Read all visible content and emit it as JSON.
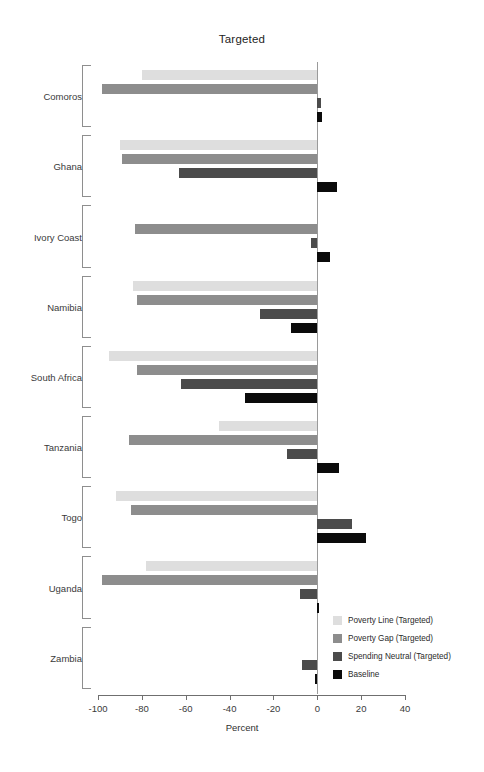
{
  "chart_data": {
    "type": "bar",
    "orientation": "horizontal",
    "title": "Targeted",
    "xlabel": "Percent",
    "ylabel": "",
    "xlim": [
      -100,
      40
    ],
    "xticks": [
      -100,
      -80,
      -60,
      -40,
      -20,
      0,
      20,
      40
    ],
    "xticklabels": [
      "-100",
      "-80",
      "-60",
      "-40",
      "-20",
      "0",
      "20",
      "40"
    ],
    "grid": false,
    "zero_line": true,
    "legend_position": "bottom-right",
    "categories": [
      "Comoros",
      "Ghana",
      "Ivory Coast",
      "Namibia",
      "South Africa",
      "Tanzania",
      "Togo",
      "Uganda",
      "Zambia"
    ],
    "series": [
      {
        "name": "Poverty Line (Targeted)",
        "color": "#dedede",
        "values": [
          -80,
          -90,
          0,
          -84,
          -95,
          -45,
          -92,
          -78,
          0
        ]
      },
      {
        "name": "Poverty Gap (Targeted)",
        "color": "#8d8d8d",
        "values": [
          -98,
          -89,
          -83,
          -82,
          -82,
          -86,
          -85,
          -98,
          0
        ]
      },
      {
        "name": "Spending Neutral (Targeted)",
        "color": "#4b4b4b",
        "values": [
          1.5,
          -63,
          -3,
          -26,
          -62,
          -14,
          16,
          -8,
          -7
        ]
      },
      {
        "name": "Baseline",
        "color": "#0b0b0b",
        "values": [
          2,
          9,
          6,
          -12,
          -33,
          10,
          22,
          1,
          -1
        ]
      }
    ]
  }
}
